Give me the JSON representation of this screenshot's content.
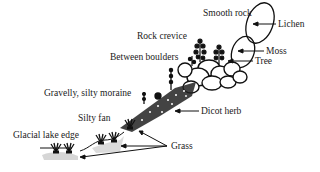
{
  "diagram": {
    "type": "illustration",
    "habitat_labels": [
      {
        "id": "smooth-rock",
        "text": "Smooth rock",
        "x": 203,
        "y": 9
      },
      {
        "id": "rock-crevice",
        "text": "Rock crevice",
        "x": 137,
        "y": 32
      },
      {
        "id": "between-boulders",
        "text": "Between boulders",
        "x": 110,
        "y": 53
      },
      {
        "id": "gravelly-silty-moraine",
        "text": "Gravelly, silty moraine",
        "x": 44,
        "y": 89
      },
      {
        "id": "silty-fan",
        "text": "Silty fan",
        "x": 78,
        "y": 114
      },
      {
        "id": "glacial-lake-edge",
        "text": "Glacial lake edge",
        "x": 13,
        "y": 131
      }
    ],
    "plant_labels": [
      {
        "id": "lichen",
        "text": "Lichen",
        "x": 278,
        "y": 20
      },
      {
        "id": "moss",
        "text": "Moss",
        "x": 266,
        "y": 47
      },
      {
        "id": "tree",
        "text": "Tree",
        "x": 255,
        "y": 57
      },
      {
        "id": "dicot-herb",
        "text": "Dicot herb",
        "x": 201,
        "y": 107
      },
      {
        "id": "grass",
        "text": "Grass",
        "x": 171,
        "y": 142
      }
    ]
  },
  "colors": {
    "ink": "#111111",
    "background": "#ffffff"
  }
}
